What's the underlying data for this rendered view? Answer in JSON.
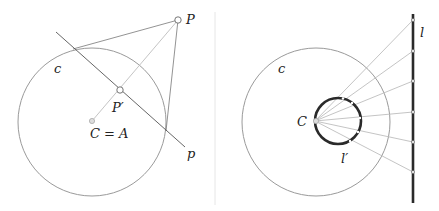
{
  "left_figure": {
    "circle_label": "c",
    "center_label": "C = A",
    "point_label": "P",
    "inverse_label": "P′",
    "polar_label": "p"
  },
  "right_figure": {
    "circle_label": "c",
    "center_label": "C",
    "line_label": "l",
    "image_label": "l′",
    "line_points_count": 6
  },
  "colors": {
    "circle_stroke": "#9a9a9a",
    "line_stroke": "#555555",
    "light_line": "#b8b8b8",
    "thick_stroke": "#2a2a2a",
    "divider": "#e4e4e4"
  }
}
